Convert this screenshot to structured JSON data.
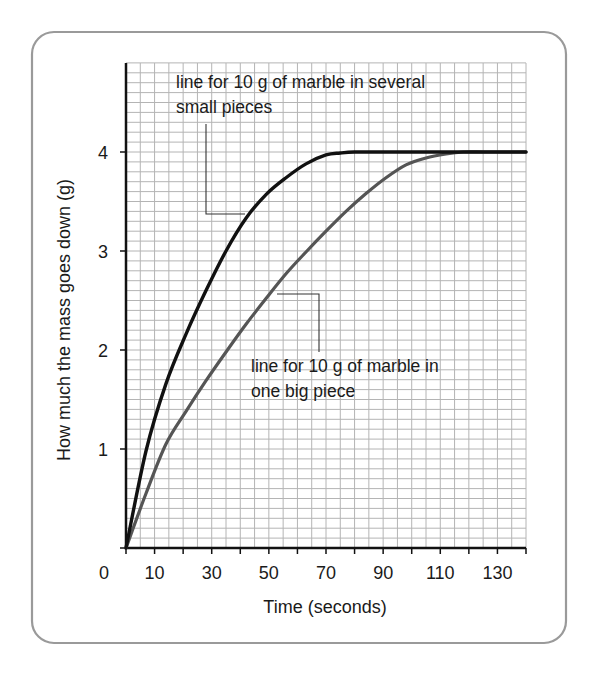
{
  "chart_data": {
    "type": "line",
    "title": "",
    "xlabel": "Time (seconds)",
    "ylabel": "How much the mass goes down (g)",
    "xlim": [
      0,
      140
    ],
    "ylim": [
      0,
      4.9
    ],
    "x_ticks": [
      0,
      10,
      20,
      30,
      40,
      50,
      60,
      70,
      80,
      90,
      100,
      110,
      120,
      130,
      140
    ],
    "x_tick_labels": [
      {
        "value": 0,
        "label": "0"
      },
      {
        "value": 10,
        "label": "10"
      },
      {
        "value": 30,
        "label": "30"
      },
      {
        "value": 50,
        "label": "50"
      },
      {
        "value": 70,
        "label": "70"
      },
      {
        "value": 90,
        "label": "90"
      },
      {
        "value": 110,
        "label": "110"
      },
      {
        "value": 130,
        "label": "130"
      }
    ],
    "y_ticks": [
      0,
      1,
      2,
      3,
      4
    ],
    "y_tick_labels": [
      {
        "value": 1,
        "label": "1"
      },
      {
        "value": 2,
        "label": "2"
      },
      {
        "value": 3,
        "label": "3"
      },
      {
        "value": 4,
        "label": "4"
      }
    ],
    "grid": {
      "on": true,
      "x_minor_step": 5,
      "y_minor_step": 0.1
    },
    "legend": {
      "position": "none"
    },
    "series": [
      {
        "name": "line for 10 g of marble in several small pieces",
        "color": "#111111",
        "x": [
          0,
          7,
          14,
          21,
          28,
          35,
          42,
          49,
          56,
          63,
          70,
          75,
          80,
          90,
          100,
          110,
          120,
          130,
          140
        ],
        "values": [
          0,
          0.98,
          1.66,
          2.16,
          2.6,
          3.0,
          3.33,
          3.57,
          3.74,
          3.88,
          3.97,
          3.99,
          4.0,
          4.0,
          4.0,
          4.0,
          4.0,
          4.0,
          4.0
        ]
      },
      {
        "name": "line for 10 g of marble in one big piece",
        "color": "#555555",
        "x": [
          0,
          7,
          14,
          21,
          28,
          35,
          42,
          49,
          56,
          63,
          70,
          77,
          84,
          91,
          98,
          105,
          112,
          118,
          125,
          130,
          140
        ],
        "values": [
          0,
          0.55,
          1.05,
          1.38,
          1.69,
          1.98,
          2.26,
          2.52,
          2.77,
          2.99,
          3.2,
          3.4,
          3.58,
          3.74,
          3.87,
          3.94,
          3.98,
          4.0,
          4.0,
          4.0,
          4.0
        ]
      }
    ],
    "annotations": [
      {
        "lines": [
          "line for 10 g of marble in several",
          "small pieces"
        ],
        "points_to_series": 0,
        "points_to": {
          "x": 42,
          "y": 3.35
        }
      },
      {
        "lines": [
          "line for 10 g of marble in",
          "one big piece"
        ],
        "points_to_series": 1,
        "points_to": {
          "x": 53,
          "y": 2.55
        }
      }
    ]
  },
  "axes": {
    "x_title": "Time (seconds)",
    "y_title": "How much the mass goes down (g)",
    "origin_label": "0"
  },
  "annotations": {
    "small_pieces": {
      "line1": "line for 10 g of marble in several",
      "line2": "small pieces"
    },
    "big_piece": {
      "line1": "line for 10 g of marble in",
      "line2": "one big piece"
    }
  }
}
